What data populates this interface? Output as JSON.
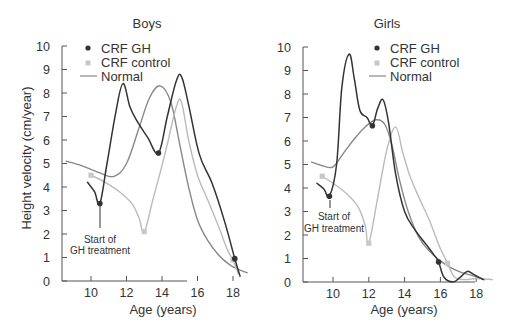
{
  "chart_data": [
    {
      "type": "line",
      "title": "Boys",
      "xlabel": "Age (years)",
      "ylabel": "Height velocity (cm/year)",
      "xticks": [
        10,
        12,
        14,
        16,
        18
      ],
      "yticks": [
        0,
        1,
        2,
        3,
        4,
        5,
        6,
        7,
        8,
        9,
        10
      ],
      "xlim": [
        8.4,
        18.8
      ],
      "ylim": [
        0,
        10
      ],
      "grid": false,
      "legend_position": "upper-left",
      "legend": [
        "CRF GH",
        "CRF control",
        "Normal"
      ],
      "annotations": [
        {
          "text": "Start of GH treatment",
          "x": 10.5,
          "y": 3.3
        }
      ],
      "series": [
        {
          "name": "CRF GH",
          "color": "#333333",
          "marker_points": [
            [
              10.5,
              3.3
            ],
            [
              13.8,
              5.45
            ],
            [
              18.1,
              0.95
            ]
          ],
          "x": [
            9.8,
            10.2,
            10.5,
            10.9,
            11.4,
            11.8,
            12.2,
            12.6,
            13.2,
            13.8,
            14.3,
            14.8,
            15.1,
            15.5,
            16.1,
            16.8,
            17.5,
            18.1,
            18.4
          ],
          "y": [
            4.2,
            3.8,
            3.3,
            5.0,
            7.2,
            8.4,
            7.4,
            6.8,
            6.1,
            5.45,
            7.0,
            8.5,
            8.7,
            7.5,
            5.4,
            4.2,
            2.6,
            0.95,
            0.2
          ]
        },
        {
          "name": "CRF control",
          "color": "#bbbbbb",
          "marker_points": [
            [
              10.0,
              4.5
            ],
            [
              13.0,
              2.1
            ],
            [
              18.0,
              0.9
            ]
          ],
          "x": [
            10.0,
            10.8,
            11.6,
            12.3,
            12.7,
            13.0,
            13.5,
            14.2,
            14.8,
            15.1,
            15.5,
            16.0,
            16.6,
            17.2,
            17.7,
            18.0,
            18.3
          ],
          "y": [
            4.5,
            4.2,
            3.8,
            3.3,
            2.7,
            2.1,
            3.5,
            5.5,
            7.4,
            7.6,
            6.0,
            4.5,
            3.4,
            2.3,
            1.3,
            0.9,
            0.3
          ]
        },
        {
          "name": "Normal",
          "color": "#888888",
          "x": [
            8.6,
            9.5,
            10.5,
            11.3,
            12.0,
            12.7,
            13.3,
            13.9,
            14.5,
            15.0,
            15.5,
            16.0,
            16.6,
            17.2,
            17.8,
            18.3,
            18.8
          ],
          "y": [
            5.1,
            4.9,
            4.6,
            4.45,
            5.0,
            6.5,
            7.8,
            8.3,
            7.6,
            5.8,
            4.0,
            2.6,
            1.7,
            1.1,
            0.7,
            0.5,
            0.35
          ]
        }
      ]
    },
    {
      "type": "line",
      "title": "Girls",
      "xlabel": "Age (years)",
      "ylabel": "",
      "xticks": [
        10,
        12,
        14,
        16,
        18
      ],
      "yticks": [
        0,
        1,
        2,
        3,
        4,
        5,
        6,
        7,
        8,
        9,
        10
      ],
      "xlim": [
        8.3,
        18.9
      ],
      "ylim": [
        0,
        10
      ],
      "grid": false,
      "legend_position": "upper-center",
      "legend": [
        "CRF GH",
        "CRF control",
        "Normal"
      ],
      "annotations": [
        {
          "text": "Start of GH treatment",
          "x": 9.8,
          "y": 3.65
        }
      ],
      "series": [
        {
          "name": "CRF GH",
          "color": "#333333",
          "marker_points": [
            [
              9.8,
              3.65
            ],
            [
              12.2,
              6.65
            ],
            [
              15.9,
              0.85
            ]
          ],
          "x": [
            9.1,
            9.5,
            9.8,
            10.2,
            10.5,
            10.9,
            11.2,
            11.5,
            11.9,
            12.2,
            12.5,
            12.8,
            13.1,
            13.5,
            14.0,
            14.6,
            15.2,
            15.6,
            15.9,
            16.2,
            16.7,
            17.1,
            17.5,
            17.9,
            18.4
          ],
          "y": [
            4.2,
            3.95,
            3.65,
            5.0,
            8.3,
            9.7,
            8.6,
            7.3,
            7.0,
            6.65,
            7.4,
            7.75,
            6.8,
            4.6,
            3.0,
            2.2,
            1.6,
            1.2,
            0.85,
            0.2,
            0.0,
            0.2,
            0.45,
            0.3,
            0.1
          ]
        },
        {
          "name": "CRF control",
          "color": "#bbbbbb",
          "marker_points": [
            [
              9.4,
              4.5
            ],
            [
              12.0,
              1.65
            ],
            [
              16.4,
              0.8
            ]
          ],
          "x": [
            9.4,
            10.0,
            10.7,
            11.4,
            11.8,
            12.0,
            12.5,
            13.0,
            13.5,
            13.9,
            14.3,
            14.8,
            15.4,
            15.9,
            16.4,
            16.8,
            17.4,
            18.0,
            18.9
          ],
          "y": [
            4.5,
            4.2,
            3.8,
            3.2,
            2.4,
            1.65,
            3.6,
            5.6,
            6.6,
            5.5,
            4.5,
            3.6,
            2.6,
            1.6,
            0.8,
            0.2,
            0.1,
            0.15,
            0.1
          ]
        },
        {
          "name": "Normal",
          "color": "#888888",
          "x": [
            8.8,
            9.4,
            10.0,
            10.6,
            11.2,
            11.8,
            12.4,
            12.9,
            13.3,
            13.7,
            14.2,
            14.8,
            15.4,
            16.0,
            16.6,
            17.2,
            17.9,
            18.5
          ],
          "y": [
            5.1,
            4.95,
            4.9,
            5.5,
            6.1,
            6.6,
            6.9,
            6.7,
            5.8,
            4.4,
            3.0,
            1.9,
            1.3,
            0.9,
            0.6,
            0.4,
            0.25,
            0.1
          ]
        }
      ]
    }
  ],
  "labels": {
    "boys_title": "Boys",
    "girls_title": "Girls",
    "xlabel": "Age (years)",
    "ylabel": "Height velocity (cm/year)",
    "legend_gh": "CRF GH",
    "legend_control": "CRF control",
    "legend_normal": "Normal",
    "annot_line1": "Start of",
    "annot_line2": "GH treatment",
    "xt": [
      "10",
      "12",
      "14",
      "16",
      "18"
    ],
    "yt": [
      "0",
      "1",
      "2",
      "3",
      "4",
      "5",
      "6",
      "7",
      "8",
      "9",
      "10"
    ]
  }
}
